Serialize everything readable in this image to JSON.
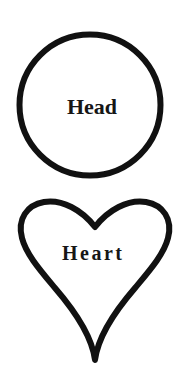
{
  "diagram": {
    "type": "two-shape-outline-diagram",
    "background_color": "#ffffff",
    "stroke_color": "#111111",
    "text_color": "#161616",
    "shapes": [
      {
        "name": "circle",
        "label": "Head",
        "outline_only": true,
        "stroke_width_px": 6,
        "center_x": 90,
        "center_y": 105,
        "radius_px": 71
      },
      {
        "name": "heart",
        "label": "Heart",
        "outline_only": true,
        "stroke_width_px": 6,
        "top_y": 202,
        "bottom_tip_y": 358,
        "left_x": 21,
        "right_x": 170,
        "notch_y": 226,
        "tip_x": 95
      }
    ]
  },
  "labels": {
    "head": "Head",
    "heart": "Heart"
  },
  "icons": {
    "circle": "circle-outline-icon",
    "heart": "heart-outline-icon"
  }
}
